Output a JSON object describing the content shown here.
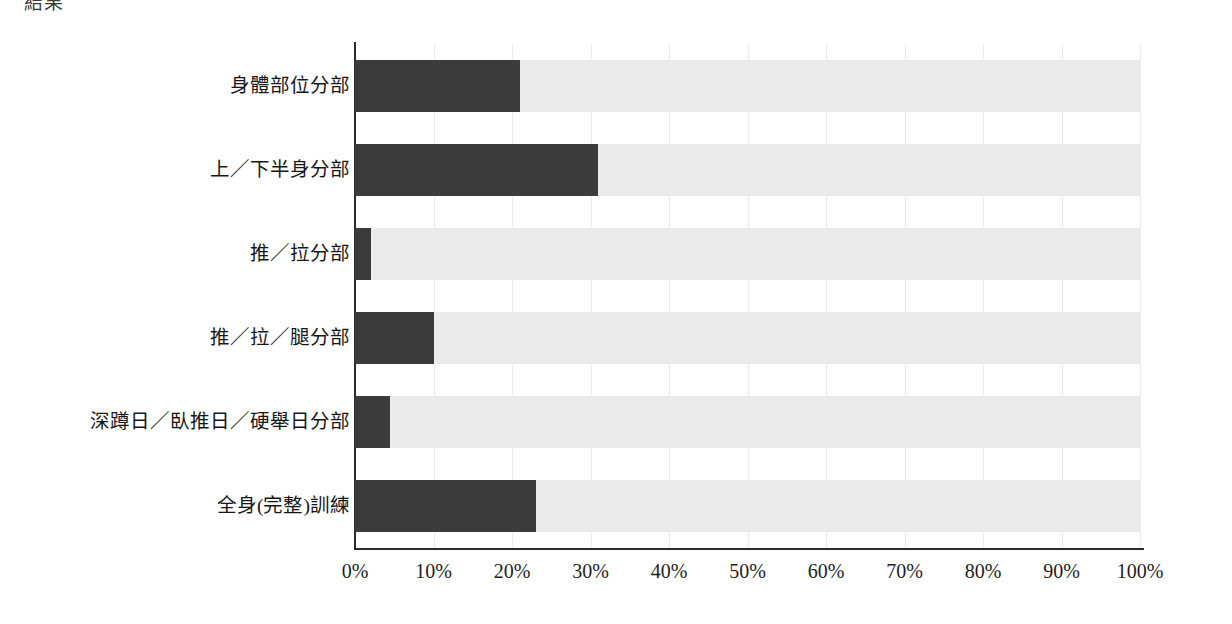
{
  "top_caption": "結果",
  "chart_data": {
    "type": "bar",
    "orientation": "horizontal",
    "title": "",
    "subtitle": "",
    "xlabel": "",
    "ylabel": "",
    "xlim": [
      0,
      100
    ],
    "xticks": [
      0,
      10,
      20,
      30,
      40,
      50,
      60,
      70,
      80,
      90,
      100
    ],
    "xtick_labels": [
      "0%",
      "10%",
      "20%",
      "30%",
      "40%",
      "50%",
      "60%",
      "70%",
      "80%",
      "90%",
      "100%"
    ],
    "grid": true,
    "legend": false,
    "legend_position": "none",
    "categories": [
      "身體部位分部",
      "上／下半身分部",
      "推／拉分部",
      "推／拉／腿分部",
      "深蹲日／臥推日／硬舉日分部",
      "全身(完整)訓練"
    ],
    "values": [
      21,
      31,
      2,
      10,
      4.5,
      23
    ],
    "track_value": 100,
    "bar_color": "#3b3b3b",
    "track_color": "#ebebeb",
    "axis_color": "#2b2b2b",
    "grid_color": "#ececec",
    "background_color": "#ffffff"
  }
}
